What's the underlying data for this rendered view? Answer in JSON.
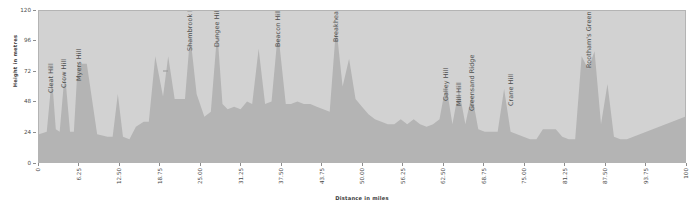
{
  "chart_data": {
    "type": "area",
    "title": "",
    "xlabel": "Distance in miles",
    "ylabel": "Height in metres",
    "xlim": [
      0,
      100
    ],
    "ylim": [
      0,
      120
    ],
    "grid": false,
    "legend": "none",
    "x_ticks": [
      "0",
      "6.25",
      "12.50",
      "18.75",
      "25.00",
      "31.25",
      "37.50",
      "43.75",
      "50.00",
      "56.25",
      "62.50",
      "68.75",
      "75.00",
      "81.25",
      "87.50",
      "93.75",
      "100"
    ],
    "x_tick_values": [
      0,
      6.25,
      12.5,
      18.75,
      25,
      31.25,
      37.5,
      43.75,
      50,
      56.25,
      62.5,
      68.75,
      75,
      81.25,
      87.5,
      93.75,
      100
    ],
    "y_ticks": [
      "0",
      "24",
      "48",
      "72",
      "96",
      "120"
    ],
    "y_tick_values": [
      0,
      24,
      48,
      72,
      96,
      120
    ],
    "area_fill_color": "#b4b4b4",
    "plot_background_color": "#d2d2d2",
    "axis_text_color": "#4a4a4a",
    "series": [
      {
        "name": "Elevation profile",
        "x": [
          0,
          1.2,
          2.0,
          2.6,
          3.2,
          4.0,
          4.8,
          5.4,
          6.0,
          6.6,
          7.4,
          9.0,
          10.6,
          11.4,
          12.2,
          13.0,
          14.0,
          15.0,
          16.2,
          17.0,
          18.0,
          19.2,
          20.0,
          21.0,
          21.8,
          22.6,
          23.4,
          24.4,
          25.6,
          26.6,
          27.6,
          28.4,
          29.2,
          30.2,
          31.2,
          32.2,
          33.0,
          34.0,
          35.0,
          36.0,
          37.0,
          38.2,
          39.0,
          40.0,
          41.0,
          42.0,
          43.0,
          44.0,
          45.0,
          46.0,
          47.0,
          48.0,
          49.0,
          50.0,
          51.0,
          52.0,
          53.0,
          54.0,
          55.0,
          56.0,
          57.0,
          58.0,
          59.0,
          60.0,
          61.0,
          62.0,
          63.0,
          64.0,
          65.0,
          66.0,
          67.0,
          68.0,
          69.0,
          70.0,
          71.0,
          72.0,
          73.0,
          74.0,
          75.0,
          76.0,
          77.0,
          78.0,
          79.0,
          80.0,
          81.0,
          82.0,
          83.0,
          84.0,
          85.0,
          86.0,
          87.0,
          88.0,
          89.0,
          90.0,
          91.0,
          92.0,
          93.0,
          94.0,
          95.0,
          96.0,
          97.0,
          98.0,
          99.0,
          100.0
        ],
        "y": [
          22,
          24,
          68,
          26,
          24,
          72,
          24,
          24,
          78,
          78,
          78,
          22,
          20,
          20,
          54,
          20,
          18,
          28,
          32,
          32,
          84,
          52,
          84,
          50,
          50,
          50,
          101,
          54,
          36,
          40,
          104,
          46,
          42,
          44,
          42,
          48,
          46,
          90,
          46,
          48,
          104,
          46,
          46,
          48,
          46,
          46,
          44,
          42,
          40,
          108,
          60,
          82,
          50,
          44,
          38,
          34,
          32,
          30,
          30,
          34,
          30,
          34,
          30,
          28,
          30,
          34,
          62,
          30,
          58,
          30,
          54,
          26,
          24,
          24,
          24,
          58,
          24,
          22,
          20,
          18,
          18,
          26,
          26,
          26,
          20,
          18,
          18,
          84,
          74,
          88,
          30,
          62,
          20,
          18,
          18,
          20,
          22,
          24,
          26,
          28,
          30,
          32,
          34,
          36
        ]
      }
    ],
    "annotations": [
      {
        "label": "Cleat Hill",
        "x": 2.0,
        "peak_height": 68
      },
      {
        "label": "Crow Hill",
        "x": 4.0,
        "peak_height": 72
      },
      {
        "label": "Myers Hill",
        "x": 6.3,
        "peak_height": 78
      },
      {
        "label": "Shambrook Hill",
        "x": 23.4,
        "peak_height": 101
      },
      {
        "label": "Dungee Hill",
        "x": 27.6,
        "peak_height": 104
      },
      {
        "label": "Beacon Hill",
        "x": 37.0,
        "peak_height": 104
      },
      {
        "label": "Breakheart Hill",
        "x": 46.0,
        "peak_height": 108
      },
      {
        "label": "Galley Hill",
        "x": 63.0,
        "peak_height": 62
      },
      {
        "label": "Mill Hill",
        "x": 65.0,
        "peak_height": 58
      },
      {
        "label": "Greensand Ridge",
        "x": 67.0,
        "peak_height": 54
      },
      {
        "label": "Crane Hill",
        "x": 73.0,
        "peak_height": 58
      },
      {
        "label": "Rootham's Green",
        "x": 85.0,
        "peak_height": 88
      }
    ]
  },
  "axes": {
    "y_title": "Height in metres",
    "x_title": "Distance in miles"
  }
}
